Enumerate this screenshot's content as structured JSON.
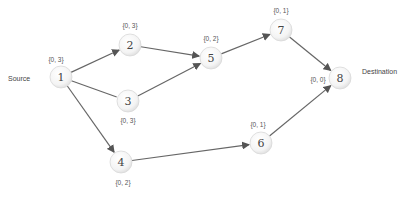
{
  "diagram": {
    "source_label": "Source",
    "destination_label": "Destination",
    "nodes": [
      {
        "id": "1",
        "x": 61,
        "y": 77,
        "label": "{0, 3}",
        "lx": 56,
        "ly": 62
      },
      {
        "id": "2",
        "x": 130,
        "y": 45,
        "label": "{0, 3}",
        "lx": 130,
        "ly": 28
      },
      {
        "id": "3",
        "x": 128,
        "y": 101,
        "label": "{0, 3}",
        "lx": 128,
        "ly": 123
      },
      {
        "id": "4",
        "x": 121,
        "y": 162,
        "label": "{0, 2}",
        "lx": 123,
        "ly": 185
      },
      {
        "id": "5",
        "x": 211,
        "y": 58,
        "label": "{0, 2}",
        "lx": 211,
        "ly": 41
      },
      {
        "id": "6",
        "x": 261,
        "y": 143,
        "label": "{0, 1}",
        "lx": 258,
        "ly": 127
      },
      {
        "id": "7",
        "x": 281,
        "y": 30,
        "label": "{0, 1}",
        "lx": 281,
        "ly": 13
      },
      {
        "id": "8",
        "x": 340,
        "y": 78,
        "label": "{0, 0}",
        "lx": 318,
        "ly": 82
      }
    ],
    "edges": [
      {
        "from": "1",
        "to": "2",
        "arrow": true
      },
      {
        "from": "1",
        "to": "3",
        "arrow": false
      },
      {
        "from": "1",
        "to": "4",
        "arrow": true
      },
      {
        "from": "2",
        "to": "5",
        "arrow": true
      },
      {
        "from": "3",
        "to": "5",
        "arrow": true
      },
      {
        "from": "4",
        "to": "6",
        "arrow": true
      },
      {
        "from": "5",
        "to": "7",
        "arrow": true
      },
      {
        "from": "7",
        "to": "8",
        "arrow": true
      },
      {
        "from": "6",
        "to": "8",
        "arrow": true
      }
    ]
  }
}
